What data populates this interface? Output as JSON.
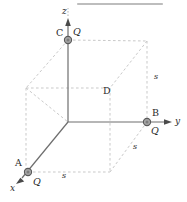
{
  "figure": {
    "name": "cube-point-charges-diagram",
    "background": "#ffffff",
    "colors": {
      "axis": "#6e6e6e",
      "dashed_edge": "#c8c8c8",
      "charge_fill": "#a8a8a8",
      "charge_ring": "#5a5a5a",
      "label": "#2b2b2b",
      "top_rule": "#bdbdbd"
    },
    "axes": [
      {
        "id": "z",
        "label": "z",
        "direction": "up"
      },
      {
        "id": "y",
        "label": "y",
        "direction": "right"
      },
      {
        "id": "x",
        "label": "x",
        "direction": "down-left"
      }
    ],
    "points": [
      {
        "id": "A",
        "label": "A",
        "charge": "Q",
        "has_charge": true
      },
      {
        "id": "B",
        "label": "B",
        "charge": "Q",
        "has_charge": true
      },
      {
        "id": "C",
        "label": "C",
        "charge": "Q",
        "has_charge": true
      },
      {
        "id": "D",
        "label": "D",
        "charge": "",
        "has_charge": false
      }
    ],
    "dimensions": [
      {
        "id": "s-right",
        "label": "s"
      },
      {
        "id": "s-diagonal",
        "label": "s"
      },
      {
        "id": "s-bottom",
        "label": "s"
      }
    ]
  }
}
